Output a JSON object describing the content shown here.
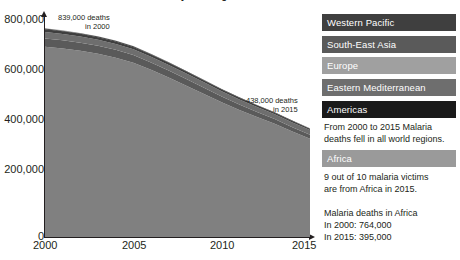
{
  "title": "Global malaria deaths by WHO region",
  "chart_data": {
    "type": "area",
    "stacked": true,
    "title": "Global malaria deaths by WHO region",
    "xlabel": "",
    "ylabel": "",
    "x": [
      2000,
      2001,
      2002,
      2003,
      2004,
      2005,
      2006,
      2007,
      2008,
      2009,
      2010,
      2011,
      2012,
      2013,
      2014,
      2015
    ],
    "xticks": [
      "2000",
      "2005",
      "2010",
      "2015"
    ],
    "xlim": [
      2000,
      2015
    ],
    "ylim": [
      0,
      880000
    ],
    "yticks": [
      "0",
      "200,000",
      "400,000",
      "600,000",
      "800,000"
    ],
    "ytick_values": [
      0,
      200000,
      400000,
      600000,
      800000
    ],
    "grid": false,
    "legend_position": "right",
    "series": [
      {
        "name": "Africa",
        "color": "#808080",
        "values": [
          764000,
          757000,
          748000,
          736000,
          720000,
          700000,
          672000,
          641000,
          608000,
          575000,
          541000,
          510000,
          482000,
          455000,
          424000,
          395000
        ]
      },
      {
        "name": "South-East Asia",
        "color": "#5a5a5a",
        "values": [
          34000,
          33500,
          33000,
          32500,
          32000,
          31000,
          29500,
          28000,
          26500,
          25000,
          23500,
          22000,
          20500,
          19000,
          17500,
          16000
        ]
      },
      {
        "name": "Eastern Mediterranean",
        "color": "#6e6e6e",
        "values": [
          26000,
          25500,
          25000,
          24500,
          24000,
          23500,
          23000,
          22500,
          22000,
          21500,
          21000,
          20500,
          20000,
          19500,
          19000,
          18500
        ]
      },
      {
        "name": "Western Pacific",
        "color": "#3f3f3f",
        "values": [
          11000,
          10700,
          10400,
          10100,
          9800,
          9400,
          9000,
          8600,
          8200,
          7800,
          7400,
          7000,
          6600,
          6200,
          5800,
          5500
        ]
      },
      {
        "name": "Americas",
        "color": "#1a1a1a",
        "values": [
          2500,
          2450,
          2400,
          2350,
          2300,
          2200,
          2100,
          2000,
          1900,
          1800,
          1700,
          1650,
          1600,
          1550,
          1500,
          1450
        ]
      },
      {
        "name": "Europe",
        "color": "#a0a0a0",
        "values": [
          1500,
          1400,
          1300,
          1200,
          1100,
          900,
          750,
          600,
          500,
          400,
          300,
          250,
          200,
          150,
          100,
          50
        ]
      }
    ],
    "totals": {
      "2000": 839000,
      "2015": 438000
    },
    "annotations": [
      {
        "line1": "839,000 deaths",
        "line2": "in 2000"
      },
      {
        "line1": "438,000 deaths",
        "line2": "in 2015"
      }
    ]
  },
  "axis": {
    "y_ticks": [
      "800,000",
      "600,000",
      "400,000",
      "200,000",
      "0"
    ],
    "x_ticks": [
      "2000",
      "2005",
      "2010",
      "2015"
    ]
  },
  "callouts": {
    "top": {
      "line1": "839,000 deaths",
      "line2": "in 2000"
    },
    "right": {
      "line1": "438,000 deaths",
      "line2": "in 2015"
    }
  },
  "legend": {
    "items": [
      {
        "label": "Western Pacific",
        "color": "#3f3f3f"
      },
      {
        "label": "South-East Asia",
        "color": "#5a5a5a"
      },
      {
        "label": "Europe",
        "color": "#a0a0a0"
      },
      {
        "label": "Eastern Mediterranean",
        "color": "#6e6e6e"
      },
      {
        "label": "Americas",
        "color": "#1a1a1a"
      }
    ],
    "africa": {
      "label": "Africa",
      "color": "#9a9a9a"
    }
  },
  "notes": {
    "regions_note_line1": "From 2000 to 2015 Malaria",
    "regions_note_line2": "deaths fell in all world regions.",
    "africa_note_line1": "9 out of 10 malaria victims",
    "africa_note_line2": "are from Africa in 2015.",
    "africa_stat_title": "Malaria deaths in Africa",
    "africa_stat_2000": " In 2000: 764,000",
    "africa_stat_2015": " In 2015: 395,000"
  }
}
